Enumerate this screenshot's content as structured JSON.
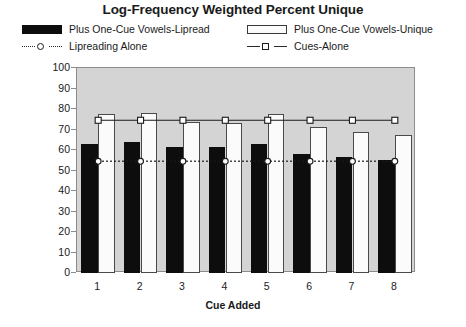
{
  "chart_data": {
    "type": "bar",
    "title": "Log-Frequency Weighted Percent Unique",
    "xlabel": "Cue Added",
    "ylabel": "",
    "categories": [
      "1",
      "2",
      "3",
      "4",
      "5",
      "6",
      "7",
      "8"
    ],
    "ylim": [
      0,
      100
    ],
    "yticks": [
      0,
      10,
      20,
      30,
      40,
      50,
      60,
      70,
      80,
      90,
      100
    ],
    "grid": false,
    "legend_position": "top",
    "series": [
      {
        "name": "Plus One-Cue Vowels-Lipread",
        "kind": "bar",
        "color": "#0d0d0d",
        "values": [
          63,
          64,
          61.5,
          61.5,
          63,
          58,
          56.5,
          55
        ]
      },
      {
        "name": "Plus One-Cue Vowels-Unique",
        "kind": "bar",
        "color": "#fbfbfb",
        "values": [
          77.5,
          78,
          73.5,
          73,
          77.5,
          71,
          69,
          67.5
        ]
      },
      {
        "name": "Lipreading Alone",
        "kind": "line-dotted",
        "color": "#1a1a1a",
        "marker": "circle",
        "values": [
          54.5,
          54.5,
          54.5,
          54.5,
          54.5,
          54.5,
          54.5,
          54.5
        ]
      },
      {
        "name": "Cues-Alone",
        "kind": "line-solid",
        "color": "#1a1a1a",
        "marker": "square",
        "values": [
          74.5,
          74.5,
          74.5,
          74.5,
          74.5,
          74.5,
          74.5,
          74.5
        ]
      }
    ]
  },
  "legend": {
    "entries": [
      {
        "label": "Plus One-Cue Vowels-Lipread",
        "marker": "filled-swatch"
      },
      {
        "label": "Plus One-Cue Vowels-Unique",
        "marker": "hollow-swatch"
      },
      {
        "label": "Lipreading Alone",
        "marker": "dotted-line-circle"
      },
      {
        "label": "Cues-Alone",
        "marker": "solid-line-square"
      }
    ]
  },
  "colors": {
    "plot_background": "#d4d4d4",
    "bar_dark": "#0d0d0d",
    "bar_light": "#fbfbfb",
    "axis": "#8c8c8c",
    "text": "#1a1a1a"
  }
}
